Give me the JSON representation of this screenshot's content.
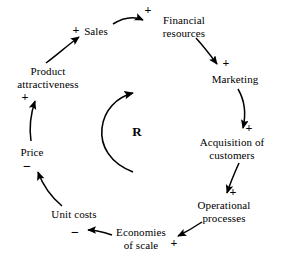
{
  "diagram": {
    "type": "causal-loop-diagram",
    "title": "",
    "background_color": "#ffffff",
    "stroke_color": "#000000",
    "loop_marker": {
      "label": "R",
      "name": "reinforcing-loop-marker",
      "direction": "clockwise",
      "x": 137,
      "y": 132
    },
    "nodes": [
      {
        "id": "sales",
        "name": "node-sales",
        "lines": [
          "Sales"
        ],
        "x": 96,
        "y": 31
      },
      {
        "id": "financial-resources",
        "name": "node-financial-resources",
        "lines": [
          "Financial",
          "resources"
        ],
        "x": 184,
        "y": 26
      },
      {
        "id": "marketing",
        "name": "node-marketing",
        "lines": [
          "Marketing"
        ],
        "x": 235,
        "y": 79
      },
      {
        "id": "acquisition-of-customers",
        "name": "node-acquisition-of-customers",
        "lines": [
          "Acquisition of",
          "customers"
        ],
        "x": 232,
        "y": 148
      },
      {
        "id": "operational-processes",
        "name": "node-operational-processes",
        "lines": [
          "Operational",
          "processes"
        ],
        "x": 224,
        "y": 211
      },
      {
        "id": "economies-of-scale",
        "name": "node-economies-of-scale",
        "lines": [
          "Economies",
          "of scale"
        ],
        "x": 141,
        "y": 238
      },
      {
        "id": "unit-costs",
        "name": "node-unit-costs",
        "lines": [
          "Unit costs"
        ],
        "x": 74,
        "y": 214
      },
      {
        "id": "price",
        "name": "node-price",
        "lines": [
          "Price"
        ],
        "x": 32,
        "y": 152
      },
      {
        "id": "product-attractiveness",
        "name": "node-product-attractiveness",
        "lines": [
          "Product",
          "attractiveness"
        ],
        "x": 48,
        "y": 77
      }
    ],
    "links": [
      {
        "id": "product-attractiveness-to-sales",
        "name": "link-product-attractiveness-to-sales",
        "from": "product-attractiveness",
        "to": "sales",
        "polarity": "+",
        "polarity_x": 76,
        "polarity_y": 30
      },
      {
        "id": "sales-to-financial-resources",
        "name": "link-sales-to-financial-resources",
        "from": "sales",
        "to": "financial-resources",
        "polarity": "+",
        "polarity_x": 148,
        "polarity_y": 10
      },
      {
        "id": "financial-resources-to-marketing",
        "name": "link-financial-resources-to-marketing",
        "from": "financial-resources",
        "to": "marketing",
        "polarity": "+",
        "polarity_x": 226,
        "polarity_y": 63
      },
      {
        "id": "marketing-to-acquisition-of-customers",
        "name": "link-marketing-to-acquisition-of-customers",
        "from": "marketing",
        "to": "acquisition-of-customers",
        "polarity": "+",
        "polarity_x": 249,
        "polarity_y": 128
      },
      {
        "id": "acquisition-of-customers-to-operational-processes",
        "name": "link-acquisition-of-customers-to-operational-processes",
        "from": "acquisition-of-customers",
        "to": "operational-processes",
        "polarity": "+",
        "polarity_x": 233,
        "polarity_y": 192
      },
      {
        "id": "operational-processes-to-economies-of-scale",
        "name": "link-operational-processes-to-economies-of-scale",
        "from": "operational-processes",
        "to": "economies-of-scale",
        "polarity": "+",
        "polarity_x": 174,
        "polarity_y": 243
      },
      {
        "id": "economies-of-scale-to-unit-costs",
        "name": "link-economies-of-scale-to-unit-costs",
        "from": "economies-of-scale",
        "to": "unit-costs",
        "polarity": "−",
        "polarity_x": 75,
        "polarity_y": 233
      },
      {
        "id": "unit-costs-to-price",
        "name": "link-unit-costs-to-price",
        "from": "unit-costs",
        "to": "price",
        "polarity": "−",
        "polarity_x": 27,
        "polarity_y": 167
      },
      {
        "id": "price-to-product-attractiveness",
        "name": "link-price-to-product-attractiveness",
        "from": "price",
        "to": "product-attractiveness",
        "polarity": "+",
        "polarity_x": 25,
        "polarity_y": 97
      }
    ]
  }
}
